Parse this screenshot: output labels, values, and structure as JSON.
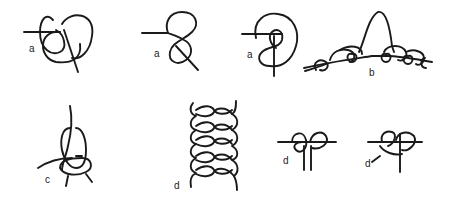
{
  "figure": {
    "background": "#ffffff",
    "ink": "#1a1a1a",
    "panels": [
      {
        "id": "a1",
        "label": "a",
        "description": "loop knot with crossing tail"
      },
      {
        "id": "a2",
        "label": "a",
        "description": "figure-eight style knot"
      },
      {
        "id": "a3",
        "label": "a",
        "description": "coiled loop knot"
      },
      {
        "id": "b",
        "label": "b",
        "description": "series of hitches along a line with a central bight"
      },
      {
        "id": "c",
        "label": "c",
        "description": "wrapped loop knot"
      },
      {
        "id": "d1",
        "label": "d",
        "description": "vertical twisted chain of loops"
      },
      {
        "id": "d2",
        "label": "d",
        "description": "double loop knot with parallel ends"
      },
      {
        "id": "d3",
        "label": "d",
        "description": "double loop knot with single end"
      }
    ]
  }
}
